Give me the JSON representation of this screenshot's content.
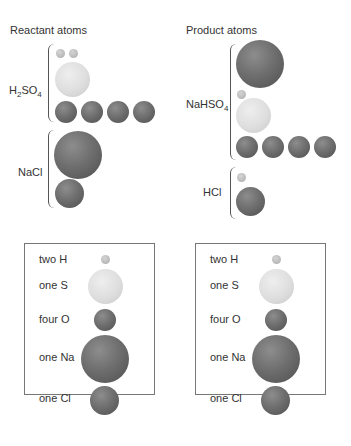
{
  "reactant": {
    "title": "Reactant atoms",
    "groups": [
      {
        "formula": "H",
        "sub1": "2",
        "mid": "SO",
        "sub2": "4"
      },
      {
        "formula": "NaCl"
      }
    ]
  },
  "product": {
    "title": "Product atoms",
    "groups": [
      {
        "formula": "NaHSO",
        "sub": "4"
      },
      {
        "formula": "HCl"
      }
    ]
  },
  "legend": {
    "rows": [
      {
        "label": "two H",
        "atom": "H"
      },
      {
        "label": "one S",
        "atom": "S"
      },
      {
        "label": "four O",
        "atom": "O"
      },
      {
        "label": "one Na",
        "atom": "Na"
      },
      {
        "label": "one Cl",
        "atom": "Cl"
      }
    ]
  },
  "colors": {
    "H": "#bcbcbc",
    "S": "#dedede",
    "O": "#6f6f6f",
    "Na": "#6f6f6f",
    "Cl": "#6f6f6f"
  }
}
